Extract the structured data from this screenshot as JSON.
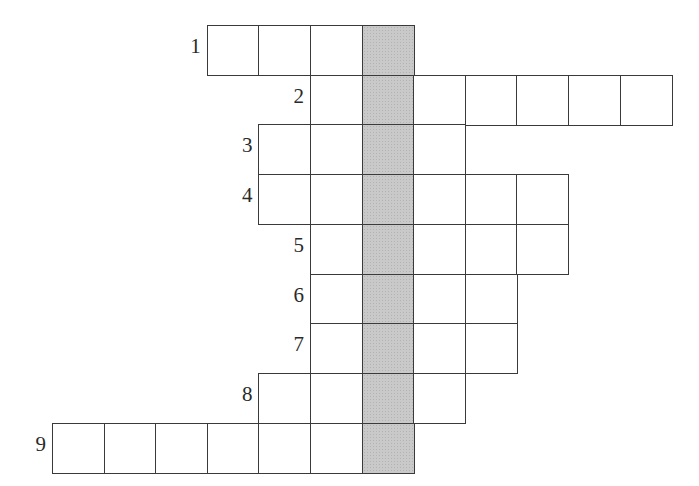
{
  "top_text_cutoff": "",
  "colors": {
    "cell_border": "#3a3a3a",
    "cell_fill": "#ffffff",
    "shaded_fill": "#c9c9c9",
    "label_color": "#2a2a2a"
  },
  "grid": {
    "origin_x": 52,
    "origin_y": 25,
    "cell_width": 51.6,
    "cell_height": 49.7,
    "total_columns": 12,
    "shaded_column": 6
  },
  "rows": [
    {
      "number": "1",
      "start_col": 3,
      "length": 4
    },
    {
      "number": "2",
      "start_col": 5,
      "length": 7
    },
    {
      "number": "3",
      "start_col": 4,
      "length": 4
    },
    {
      "number": "4",
      "start_col": 4,
      "length": 6
    },
    {
      "number": "5",
      "start_col": 5,
      "length": 5
    },
    {
      "number": "6",
      "start_col": 5,
      "length": 4
    },
    {
      "number": "7",
      "start_col": 5,
      "length": 4
    },
    {
      "number": "8",
      "start_col": 4,
      "length": 4
    },
    {
      "number": "9",
      "start_col": 0,
      "length": 7
    }
  ]
}
